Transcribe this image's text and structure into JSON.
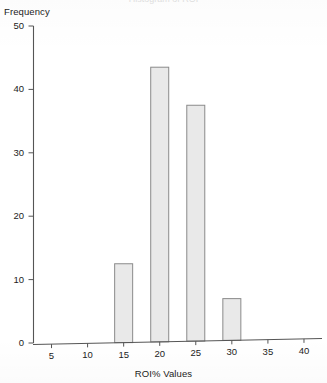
{
  "figure": {
    "cropped_title_sliver": "Histogram of ROI",
    "y_axis_title": "Frequency",
    "x_axis_title": "ROI% Values"
  },
  "chart_data": {
    "type": "bar",
    "title": "",
    "xlabel": "ROI% Values",
    "ylabel": "Frequency",
    "categories": [
      "5",
      "10",
      "15",
      "20",
      "25",
      "30",
      "35",
      "40"
    ],
    "values": [
      0,
      0,
      12.5,
      43.5,
      37.5,
      7,
      0,
      0
    ],
    "x": [
      5,
      10,
      15,
      20,
      25,
      30,
      35,
      40
    ],
    "xlim": [
      2.5,
      42.5
    ],
    "ylim": [
      0,
      50
    ],
    "xticks": [
      5,
      10,
      15,
      20,
      25,
      30,
      35,
      40
    ],
    "yticks": [
      0,
      10,
      20,
      30,
      40,
      50
    ],
    "grid": false,
    "legend": false,
    "bar_fill_color": "#e9e9e9",
    "bar_edge_color": "#8a8a8a",
    "axis_color": "#555555"
  }
}
